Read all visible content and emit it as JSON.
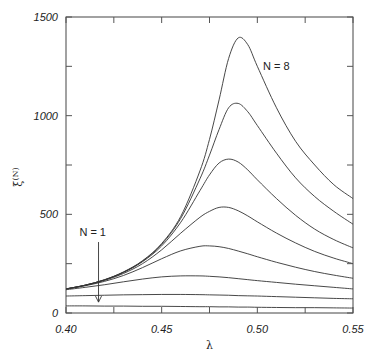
{
  "chart_data": {
    "type": "line",
    "title": "",
    "xlabel": "λ",
    "ylabel": "ξ(N)",
    "xlim": [
      0.4,
      0.55
    ],
    "ylim": [
      0,
      1500
    ],
    "grid": false,
    "legend": "none",
    "x_ticks": [
      0.4,
      0.425,
      0.45,
      0.475,
      0.5,
      0.525,
      0.55
    ],
    "x_tick_labels": [
      "0.40",
      "",
      "0.45",
      "",
      "0.50",
      "",
      "0.55"
    ],
    "y_ticks": [
      0,
      250,
      500,
      750,
      1000,
      1250,
      1500
    ],
    "y_tick_labels": [
      "0",
      "",
      "500",
      "",
      "1000",
      "",
      "1500"
    ],
    "annotations": [
      {
        "text": "N = 8",
        "x": 0.503,
        "y": 1230
      },
      {
        "text": "N = 1",
        "x": 0.407,
        "y": 390,
        "arrow_to": {
          "x": 0.417,
          "y": 45
        }
      }
    ],
    "x": [
      0.4,
      0.41,
      0.42,
      0.43,
      0.44,
      0.45,
      0.46,
      0.47,
      0.475,
      0.48,
      0.485,
      0.49,
      0.495,
      0.5,
      0.51,
      0.52,
      0.53,
      0.54,
      0.55
    ],
    "series": [
      {
        "name": "N = 1",
        "values": [
          36,
          36,
          35,
          35,
          34,
          34,
          33,
          32,
          32,
          31,
          31,
          30,
          30,
          29,
          28,
          27,
          27,
          26,
          25
        ]
      },
      {
        "name": "N = 2",
        "values": [
          86,
          88,
          90,
          92,
          93,
          94,
          94,
          93,
          92,
          91,
          90,
          88,
          87,
          86,
          83,
          80,
          77,
          74,
          72
        ]
      },
      {
        "name": "N = 3",
        "values": [
          118,
          130,
          143,
          158,
          172,
          183,
          188,
          188,
          186,
          183,
          179,
          174,
          169,
          164,
          155,
          146,
          138,
          130,
          122
        ]
      },
      {
        "name": "N = 4",
        "values": [
          121,
          138,
          160,
          190,
          230,
          275,
          315,
          338,
          340,
          336,
          327,
          314,
          300,
          285,
          257,
          232,
          210,
          192,
          176
        ]
      },
      {
        "name": "N = 5",
        "values": [
          122,
          140,
          165,
          200,
          250,
          320,
          405,
          485,
          515,
          535,
          535,
          518,
          492,
          462,
          405,
          355,
          312,
          278,
          250
        ]
      },
      {
        "name": "N = 6",
        "values": [
          122,
          141,
          167,
          205,
          260,
          340,
          460,
          620,
          700,
          760,
          780,
          765,
          725,
          675,
          580,
          495,
          425,
          372,
          330
        ]
      },
      {
        "name": "N = 7",
        "values": [
          122,
          141,
          168,
          207,
          263,
          348,
          480,
          680,
          800,
          930,
          1040,
          1062,
          1020,
          950,
          810,
          685,
          590,
          515,
          450
        ]
      },
      {
        "name": "N = 8",
        "values": [
          122,
          141,
          168,
          208,
          265,
          352,
          490,
          720,
          880,
          1080,
          1290,
          1394,
          1360,
          1250,
          1040,
          870,
          750,
          650,
          580
        ]
      }
    ]
  },
  "layout": {
    "plot": {
      "left": 66,
      "top": 17,
      "right": 353,
      "bottom": 313
    }
  }
}
